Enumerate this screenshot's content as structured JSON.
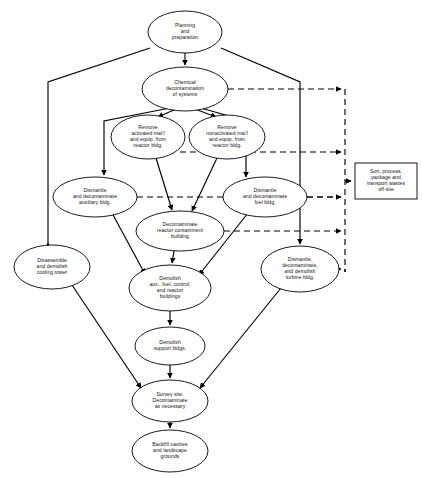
{
  "diagram": {
    "colors": {
      "background": "#ffffff",
      "stroke": "#000000",
      "text": "#111111"
    },
    "legend": {
      "solid_edge_meaning": "sequence / precedence flow",
      "dashed_edge_meaning": "waste stream to sorting and transport"
    },
    "nodes": [
      {
        "id": "planning",
        "shape": "ellipse",
        "cx": 185,
        "cy": 32,
        "rx": 37,
        "ry": 21,
        "lines": [
          "Planning",
          "and",
          "preparation"
        ]
      },
      {
        "id": "chemical-decon",
        "shape": "ellipse",
        "cx": 185,
        "cy": 89,
        "rx": 43,
        "ry": 22,
        "lines": [
          "Chemical",
          "decontamination",
          "of systems"
        ]
      },
      {
        "id": "remove-activated",
        "shape": "ellipse",
        "cx": 148,
        "cy": 137,
        "rx": 37,
        "ry": 22,
        "lines": [
          "Remove",
          "activated mat'l",
          "and equip. from",
          "reactor bldg."
        ]
      },
      {
        "id": "remove-nonactivated",
        "shape": "ellipse",
        "cx": 227,
        "cy": 137,
        "rx": 38,
        "ry": 22,
        "lines": [
          "Remove",
          "nonactivated mat'l",
          "and equip. from",
          "reactor bldg."
        ]
      },
      {
        "id": "dismantle-auxiliary",
        "shape": "ellipse",
        "cx": 95,
        "cy": 197,
        "rx": 42,
        "ry": 20,
        "lines": [
          "Dismantle",
          "and decontaminate",
          "auxiliary bldg."
        ]
      },
      {
        "id": "dismantle-fuel",
        "shape": "ellipse",
        "cx": 265,
        "cy": 197,
        "rx": 42,
        "ry": 20,
        "lines": [
          "Dismantle",
          "and decontaminate",
          "fuel bldg."
        ]
      },
      {
        "id": "decon-reactor-containment",
        "shape": "ellipse",
        "cx": 180,
        "cy": 231,
        "rx": 44,
        "ry": 20,
        "lines": [
          "Decontaminate",
          "reactor containment",
          "building"
        ]
      },
      {
        "id": "cooling-tower",
        "shape": "ellipse",
        "cx": 52,
        "cy": 267,
        "rx": 38,
        "ry": 22,
        "lines": [
          "Disassemble",
          "and demolish",
          "cooling tower"
        ]
      },
      {
        "id": "turbine-bldg",
        "shape": "ellipse",
        "cx": 300,
        "cy": 269,
        "rx": 39,
        "ry": 23,
        "lines": [
          "Dismantle,",
          "decontaminate,",
          "and demolish",
          "turbine bldg."
        ]
      },
      {
        "id": "demolish-aux-fuel-control",
        "shape": "ellipse",
        "cx": 170,
        "cy": 288,
        "rx": 41,
        "ry": 23,
        "lines": [
          "Demolish",
          "aux., fuel, control,",
          "and reactor",
          "buildings"
        ]
      },
      {
        "id": "demolish-support",
        "shape": "ellipse",
        "cx": 170,
        "cy": 346,
        "rx": 35,
        "ry": 19,
        "lines": [
          "Demolish",
          "support bldgs."
        ]
      },
      {
        "id": "survey-site",
        "shape": "ellipse",
        "cx": 170,
        "cy": 401,
        "rx": 38,
        "ry": 21,
        "lines": [
          "Survey site.",
          "Decontaminate",
          "as necessary"
        ]
      },
      {
        "id": "backfill",
        "shape": "ellipse",
        "cx": 170,
        "cy": 451,
        "rx": 38,
        "ry": 21,
        "lines": [
          "Backfill cavities",
          "and landscape",
          "grounds"
        ]
      },
      {
        "id": "sort-process-waste",
        "shape": "rect",
        "x": 355,
        "y": 163,
        "w": 62,
        "h": 36,
        "lines": [
          "Sort, process,",
          "package and",
          "transport wastes",
          "off-site"
        ]
      }
    ],
    "edges": [
      {
        "from": "planning",
        "to": "chemical-decon",
        "style": "solid"
      },
      {
        "from": "planning",
        "to": "cooling-tower",
        "style": "solid"
      },
      {
        "from": "planning",
        "to": "turbine-bldg",
        "style": "solid"
      },
      {
        "from": "chemical-decon",
        "to": "remove-activated",
        "style": "solid"
      },
      {
        "from": "chemical-decon",
        "to": "remove-nonactivated",
        "style": "solid"
      },
      {
        "from": "chemical-decon",
        "to": "dismantle-auxiliary",
        "style": "solid"
      },
      {
        "from": "chemical-decon",
        "to": "dismantle-fuel",
        "style": "solid"
      },
      {
        "from": "remove-activated",
        "to": "decon-reactor-containment",
        "style": "solid"
      },
      {
        "from": "remove-nonactivated",
        "to": "decon-reactor-containment",
        "style": "solid"
      },
      {
        "from": "dismantle-auxiliary",
        "to": "demolish-aux-fuel-control",
        "style": "solid"
      },
      {
        "from": "dismantle-fuel",
        "to": "demolish-aux-fuel-control",
        "style": "solid"
      },
      {
        "from": "decon-reactor-containment",
        "to": "demolish-aux-fuel-control",
        "style": "solid"
      },
      {
        "from": "demolish-aux-fuel-control",
        "to": "demolish-support",
        "style": "solid"
      },
      {
        "from": "demolish-support",
        "to": "survey-site",
        "style": "solid"
      },
      {
        "from": "cooling-tower",
        "to": "survey-site",
        "style": "solid"
      },
      {
        "from": "turbine-bldg",
        "to": "survey-site",
        "style": "solid"
      },
      {
        "from": "survey-site",
        "to": "backfill",
        "style": "solid"
      },
      {
        "from": "chemical-decon",
        "to": "sort-process-waste",
        "style": "dashed"
      },
      {
        "from": "dismantle-auxiliary",
        "to": "sort-process-waste",
        "style": "dashed"
      },
      {
        "from": "remove-activated",
        "to": "sort-process-waste",
        "style": "dashed"
      },
      {
        "from": "dismantle-fuel",
        "to": "sort-process-waste",
        "style": "dashed"
      },
      {
        "from": "decon-reactor-containment",
        "to": "sort-process-waste",
        "style": "dashed"
      },
      {
        "from": "turbine-bldg",
        "to": "sort-process-waste",
        "style": "dashed"
      }
    ]
  }
}
